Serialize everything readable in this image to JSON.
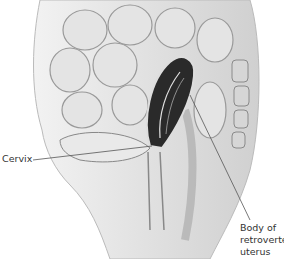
{
  "figure": {
    "labels": [
      {
        "id": "cervix",
        "text": "Cervix"
      },
      {
        "id": "body",
        "lines": [
          "Body of",
          "retroverted",
          "uterus"
        ]
      }
    ]
  },
  "colors": {
    "tissue": "#d8d8d8",
    "organ_dark": "#2a2a2a",
    "line": "#555555",
    "bg": "#ffffff"
  }
}
